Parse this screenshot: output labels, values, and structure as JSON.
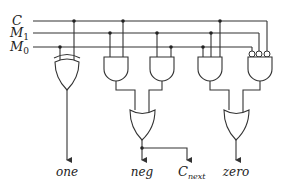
{
  "diagram": {
    "type": "logic-circuit",
    "inputs": [
      {
        "name": "C",
        "sub": ""
      },
      {
        "name": "M",
        "sub": "1"
      },
      {
        "name": "M",
        "sub": "0"
      }
    ],
    "outputs": [
      {
        "name": "one",
        "sub": ""
      },
      {
        "name": "neg",
        "sub": ""
      },
      {
        "name": "C",
        "sub": "next"
      },
      {
        "name": "zero",
        "sub": ""
      }
    ],
    "gates": [
      {
        "id": "xor1",
        "type": "XOR",
        "inputs": [
          "M0",
          "C"
        ],
        "output": "one"
      },
      {
        "id": "and1",
        "type": "AND",
        "inputs": [
          "M1",
          "C"
        ]
      },
      {
        "id": "and2",
        "type": "AND",
        "inputs": [
          "M1",
          "M0"
        ]
      },
      {
        "id": "or1",
        "type": "OR",
        "inputs": [
          "and1",
          "and2"
        ],
        "output": "neg / C_next"
      },
      {
        "id": "and3",
        "type": "AND",
        "inputs": [
          "M0",
          "M1",
          "C"
        ]
      },
      {
        "id": "and4",
        "type": "AND",
        "inputs": [
          "NOT M0",
          "NOT M1",
          "NOT C"
        ]
      },
      {
        "id": "or2",
        "type": "OR",
        "inputs": [
          "and3",
          "and4"
        ],
        "output": "zero"
      }
    ],
    "colors": {
      "line": "#333333",
      "background": "#ffffff"
    }
  }
}
